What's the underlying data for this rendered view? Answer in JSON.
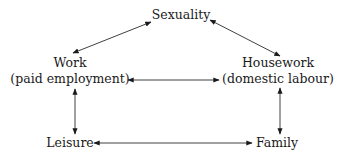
{
  "diagram": {
    "type": "relationship-diagram",
    "colors": {
      "text": "#1a1a1a",
      "line": "#2a2a2a",
      "background": "#ffffff"
    },
    "nodes": {
      "sexuality": {
        "label": "Sexuality"
      },
      "work": {
        "label": "Work",
        "sublabel": "(paid employment)"
      },
      "housework": {
        "label": "Housework",
        "sublabel": "(domestic labour)"
      },
      "leisure": {
        "label": "Leisure"
      },
      "family": {
        "label": "Family"
      }
    },
    "edges": [
      {
        "from": "Work",
        "to": "Sexuality",
        "direction": "bidirectional"
      },
      {
        "from": "Sexuality",
        "to": "Housework",
        "direction": "bidirectional"
      },
      {
        "from": "Work",
        "to": "Housework",
        "direction": "bidirectional"
      },
      {
        "from": "Work",
        "to": "Leisure",
        "direction": "bidirectional"
      },
      {
        "from": "Housework",
        "to": "Family",
        "direction": "bidirectional"
      },
      {
        "from": "Leisure",
        "to": "Family",
        "direction": "bidirectional"
      }
    ]
  }
}
